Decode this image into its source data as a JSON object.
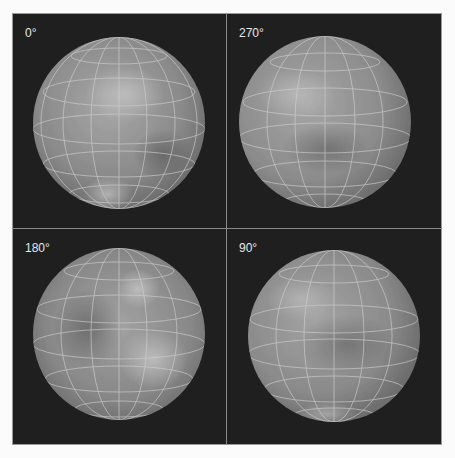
{
  "panels": [
    {
      "id": "p0",
      "label": "0°",
      "position": "top-left"
    },
    {
      "id": "p270",
      "label": "270°",
      "position": "top-right"
    },
    {
      "id": "p180",
      "label": "180°",
      "position": "bottom-left"
    },
    {
      "id": "p90",
      "label": "90°",
      "position": "bottom-right"
    }
  ],
  "colors": {
    "background": "#1f1f1f",
    "sphere": "#8c8c8c",
    "grid": "#cfcfcf",
    "label": "#e8e8e8"
  }
}
